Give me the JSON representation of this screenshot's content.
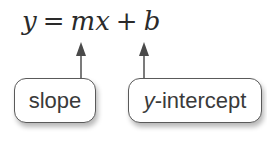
{
  "equation": {
    "y": "y",
    "equals": "=",
    "m": "m",
    "x": "x",
    "plus": "+",
    "b": "b"
  },
  "labels": {
    "slope": "slope",
    "intercept_var": "y",
    "intercept_rest": "-intercept"
  },
  "colors": {
    "text": "#2a2a2a",
    "arrow": "#5a5a5a",
    "border": "#5a5a5a"
  }
}
